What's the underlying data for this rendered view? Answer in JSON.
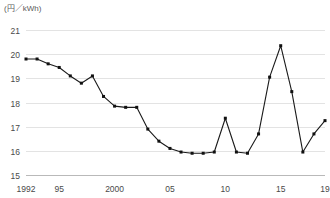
{
  "chart_data": {
    "type": "line",
    "title": "",
    "subtitle": "",
    "xlabel": "",
    "ylabel": "(円／kWh)",
    "unit_label": "(円／kWh)",
    "ylim": [
      15,
      21
    ],
    "yticks": [
      21,
      20,
      19,
      18,
      17,
      16,
      15
    ],
    "ytick_labels": [
      "21",
      "20",
      "19",
      "18",
      "17",
      "16",
      "15"
    ],
    "xlim": [
      1992,
      2019
    ],
    "xticks": [
      1992,
      1995,
      2000,
      2005,
      2010,
      2015,
      2019
    ],
    "xtick_labels": [
      "1992",
      "95",
      "2000",
      "05",
      "10",
      "15",
      "19"
    ],
    "grid": true,
    "legend": null,
    "legend_position": "none",
    "markers": true,
    "line_color": "#1a1a1a",
    "grid_color": "#e3e3e3",
    "axis_color": "#b9b9b9",
    "x": [
      1992,
      1993,
      1994,
      1995,
      1996,
      1997,
      1998,
      1999,
      2000,
      2001,
      2002,
      2003,
      2004,
      2005,
      2006,
      2007,
      2008,
      2009,
      2010,
      2011,
      2012,
      2013,
      2014,
      2015,
      2016,
      2017,
      2018,
      2019
    ],
    "categories": [
      "1992",
      "1993",
      "1994",
      "1995",
      "1996",
      "1997",
      "1998",
      "1999",
      "2000",
      "2001",
      "2002",
      "2003",
      "2004",
      "2005",
      "2006",
      "2007",
      "2008",
      "2009",
      "2010",
      "2011",
      "2012",
      "2013",
      "2014",
      "2015",
      "2016",
      "2017",
      "2018",
      "2019"
    ],
    "values": [
      19.8,
      19.8,
      19.6,
      19.45,
      19.1,
      18.8,
      19.1,
      18.25,
      17.85,
      17.8,
      17.8,
      16.9,
      16.4,
      16.1,
      15.95,
      15.9,
      15.9,
      15.95,
      17.35,
      15.95,
      15.9,
      16.7,
      19.05,
      20.35,
      18.45,
      15.95,
      16.7,
      17.25
    ],
    "series": [
      {
        "name": "電気料金単価",
        "values": [
          19.8,
          19.8,
          19.6,
          19.45,
          19.1,
          18.8,
          19.1,
          18.25,
          17.85,
          17.8,
          17.8,
          16.9,
          16.4,
          16.1,
          15.95,
          15.9,
          15.9,
          15.95,
          17.35,
          15.95,
          15.9,
          16.7,
          19.05,
          20.35,
          18.45,
          15.95,
          16.7,
          17.25
        ]
      }
    ]
  }
}
